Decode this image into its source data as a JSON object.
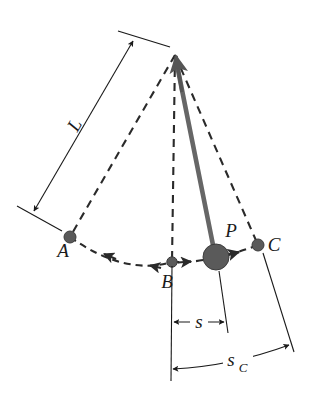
{
  "figure": {
    "kind": "physics-diagram",
    "background_color": "#ffffff",
    "ink_color": "#1a1a1a",
    "bob_color": "#5a5a5a",
    "rod_color": "#666666"
  },
  "labels": {
    "length": "L",
    "point_a": "A",
    "point_b": "B",
    "point_p": "P",
    "point_c": "C",
    "arc_s": "s",
    "arc_sc": "s",
    "arc_sc_sub": "C"
  },
  "geometry": {
    "pivot": {
      "x": 175,
      "y": 55
    },
    "point_a": {
      "x": 70,
      "y": 237,
      "r": 6
    },
    "point_b": {
      "x": 172,
      "y": 262,
      "r": 5
    },
    "point_p": {
      "x": 216,
      "y": 257,
      "r": 13
    },
    "point_c": {
      "x": 258,
      "y": 245,
      "r": 6
    }
  },
  "annotations": {
    "length_dimension": "L — distance from pivot to bob along the string",
    "s_dimension": "s — horizontal displacement of P from equilibrium B",
    "sc_dimension": "s_C — horizontal displacement of extreme point C from B"
  }
}
